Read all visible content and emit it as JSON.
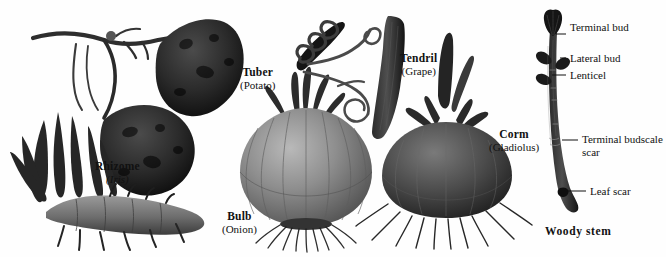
{
  "figure": {
    "kind": "botanical-illustration",
    "background_color": "#fefefe",
    "ink_color": "#111111"
  },
  "specimens": [
    {
      "id": "tuber",
      "title": "Tuber",
      "subtitle": "(Potato)",
      "subtitle_italic": false,
      "label_x": 240,
      "label_y": 66,
      "description": "two dark tubers on a branching stolon"
    },
    {
      "id": "rhizome",
      "title": "Rhizome",
      "subtitle": "(Iris)",
      "subtitle_italic": true,
      "label_x": 95,
      "label_y": 160,
      "description": "horizontal jointed rootstock with fan of leaves"
    },
    {
      "id": "bulb",
      "title": "Bulb",
      "subtitle": "(Onion)",
      "subtitle_italic": false,
      "label_x": 222,
      "label_y": 210,
      "description": "layered onion with neck leaves and fibrous roots"
    },
    {
      "id": "tendril",
      "title": "Tendril",
      "subtitle": "(Grape)",
      "subtitle_italic": false,
      "label_x": 400,
      "label_y": 52,
      "description": "coiling tendril gripping a support beside grape stem"
    },
    {
      "id": "corm",
      "title": "Corm",
      "subtitle": "(Gladiolus)",
      "subtitle_italic": false,
      "label_x": 489,
      "label_y": 128,
      "description": "squat solid corm with pointed shoot and roots"
    }
  ],
  "woody_stem": {
    "title": "Woody stem",
    "title_x": 545,
    "title_y": 225,
    "callouts": [
      {
        "id": "terminal-bud",
        "text": "Terminal bud",
        "x": 570,
        "y": 21,
        "line_x1": 556,
        "line_y1": 34,
        "line_x2": 566,
        "line_y2": 34
      },
      {
        "id": "lateral-bud",
        "text": "Lateral bud",
        "x": 570,
        "y": 52,
        "line_x1": 560,
        "line_y1": 58,
        "line_x2": 566,
        "line_y2": 58
      },
      {
        "id": "lenticel",
        "text": "Lenticel",
        "x": 570,
        "y": 69,
        "line_x1": 552,
        "line_y1": 75,
        "line_x2": 566,
        "line_y2": 75
      },
      {
        "id": "terminal-budscale-scar",
        "text": "Terminal budscale scar",
        "x": 582,
        "y": 133,
        "line_x1": 562,
        "line_y1": 140,
        "line_x2": 578,
        "line_y2": 140
      },
      {
        "id": "leaf-scar",
        "text": "Leaf scar",
        "x": 590,
        "y": 185,
        "line_x1": 568,
        "line_y1": 191,
        "line_x2": 586,
        "line_y2": 191
      }
    ]
  }
}
